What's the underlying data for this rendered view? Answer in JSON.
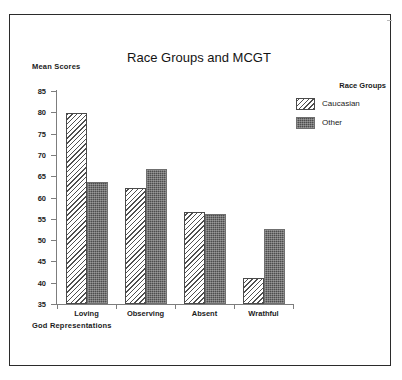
{
  "chart_data": {
    "type": "bar",
    "title": "Race Groups and MCGT",
    "xlabel": "God Representations",
    "ylabel": "Mean Scores",
    "categories": [
      "Loving",
      "Observing",
      "Absent",
      "Wrathful"
    ],
    "series": [
      {
        "name": "Caucasian",
        "values": [
          79.8,
          62.2,
          56.5,
          41.1
        ],
        "fill": "diagonal-hatch",
        "color": "#ffffff"
      },
      {
        "name": "Other",
        "values": [
          63.6,
          66.8,
          56.2,
          52.7
        ],
        "fill": "dark-stipple",
        "color": "#4d4d4d"
      }
    ],
    "ylim": [
      35,
      85
    ],
    "yticks": [
      35,
      40,
      45,
      50,
      55,
      60,
      65,
      70,
      75,
      80,
      85
    ],
    "ytick_labels": [
      "35",
      "40",
      "45",
      "50",
      "55",
      "60",
      "65",
      "70",
      "75",
      "80",
      "85"
    ],
    "grid": false,
    "legend": {
      "title": "Race Groups",
      "position": "top-right",
      "entries": [
        "Caucasian",
        "Other"
      ]
    }
  },
  "legend": {
    "title": "Race Groups",
    "entries": [
      {
        "label": "Caucasian"
      },
      {
        "label": "Other"
      }
    ]
  },
  "colors": {
    "frame": "#2b2b2b",
    "axis": "#7d7d7d",
    "text": "#1b1b1b",
    "bar_other": "#4d4d4d",
    "bar_caucasian": "#ffffff"
  }
}
